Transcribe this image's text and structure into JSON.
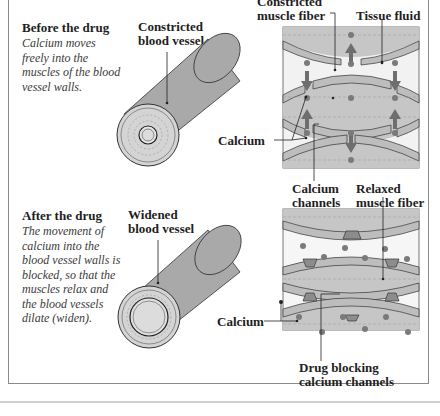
{
  "figure": {
    "top_cut_text": "… they are commonly prescribed for angina …",
    "before": {
      "heading": "Before the drug",
      "description_lines": [
        "Calcium moves",
        "freely into the",
        "muscles of the blood",
        "vessel walls."
      ],
      "vessel_label_lines": [
        "Constricted",
        "blood vessel"
      ],
      "fiber_label_lines": [
        "Constricted",
        "muscle fiber"
      ],
      "tissue_label": "Tissue fluid",
      "calcium_label": "Calcium",
      "channels_label_lines": [
        "Calcium",
        "channels"
      ]
    },
    "after": {
      "heading": "After the drug",
      "description_lines": [
        "The movement of",
        "calcium into the",
        "blood vessel walls is",
        "blocked, so that the",
        "muscles relax and",
        "the blood vessels",
        "dilate (widen)."
      ],
      "vessel_label_lines": [
        "Widened",
        "blood vessel"
      ],
      "fiber_label_lines": [
        "Relaxed",
        "muscle fiber"
      ],
      "calcium_label": "Calcium",
      "drug_label_lines": [
        "Drug blocking",
        "calcium channels"
      ]
    },
    "colors": {
      "vessel_fill": "#a9a9a9",
      "vessel_end": "#cfcfcf",
      "fiber_fill": "#c8c8c8",
      "fluid_bg": "#f3f3f3",
      "arrow": "#6e6e6e",
      "calcium_dot": "#7a7a7a",
      "drug_block": "#8c8c8c",
      "border": "#8a8a8a"
    }
  }
}
